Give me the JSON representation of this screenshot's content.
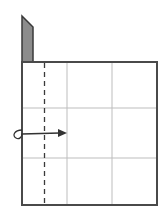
{
  "diagram": {
    "type": "origami-fold-step",
    "colors": {
      "background": "#ffffff",
      "outline": "#4a4a4a",
      "grid": "#bdbdbd",
      "fold_line": "#3a3a3a",
      "flap_fill": "#8c8c8c",
      "arrow": "#333333"
    },
    "elements": {
      "square": {
        "label": "paper-square"
      },
      "grid": {
        "columns": 3,
        "rows": 3
      },
      "fold_line": {
        "style": "dashed",
        "orientation": "vertical",
        "label": "valley-fold"
      },
      "flap": {
        "label": "shaded-flap"
      },
      "arrow": {
        "label": "fold-over-arrow",
        "direction": "right"
      }
    }
  }
}
